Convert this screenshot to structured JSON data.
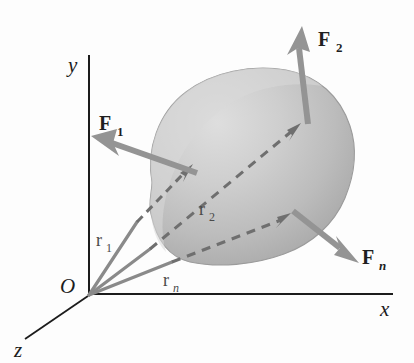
{
  "figure": {
    "background_color": "#fdfdfd"
  },
  "axes": {
    "origin_label": "O",
    "x_label": "x",
    "y_label": "y",
    "z_label": "z",
    "axis_color": "#1c1c1c",
    "origin_point": {
      "x": 89,
      "y": 295
    }
  },
  "body": {
    "name": "rigid-body-blob",
    "fill_light": "#d8d8d8",
    "fill_mid": "#b8b8b8",
    "fill_dark": "#9a9a9a",
    "outline_color": "#8f8f8f"
  },
  "forces": [
    {
      "id": "F1",
      "label": "F",
      "subscript": "1",
      "subscript_italic": false,
      "color": "#909090",
      "label_x": 103,
      "label_y": 128,
      "sub_x": 122,
      "sub_y": 134,
      "tail": {
        "x": 196,
        "y": 172
      },
      "tip": {
        "x": 93,
        "y": 141
      }
    },
    {
      "id": "F2",
      "label": "F",
      "subscript": "2",
      "subscript_italic": false,
      "color": "#909090",
      "label_x": 322,
      "label_y": 44,
      "sub_x": 341,
      "sub_y": 50,
      "tail": {
        "x": 306,
        "y": 122
      },
      "tip": {
        "x": 302,
        "y": 28
      }
    },
    {
      "id": "Fn",
      "label": "F",
      "subscript": "n",
      "subscript_italic": true,
      "color": "#909090",
      "label_x": 365,
      "label_y": 262,
      "sub_x": 383,
      "sub_y": 268,
      "tail": {
        "x": 294,
        "y": 212
      },
      "tip": {
        "x": 358,
        "y": 262
      }
    }
  ],
  "position_vectors": [
    {
      "id": "r1",
      "label": "r",
      "subscript": "1",
      "subscript_italic": false,
      "color": "#8a8a8a",
      "dash_color": "#6f6f6f",
      "label_x": 100,
      "label_y": 241,
      "sub_x": 111,
      "sub_y": 247,
      "solid_start": {
        "x": 89,
        "y": 295
      },
      "solid_end": {
        "x": 137,
        "y": 222
      },
      "dash_end": {
        "x": 190,
        "y": 168
      }
    },
    {
      "id": "r2",
      "label": "r",
      "subscript": "2",
      "subscript_italic": false,
      "color": "#8a8a8a",
      "dash_color": "#6f6f6f",
      "label_x": 203,
      "label_y": 210,
      "sub_x": 214,
      "sub_y": 216,
      "solid_start": {
        "x": 89,
        "y": 295
      },
      "solid_end": {
        "x": 148,
        "y": 250
      },
      "dash_end": {
        "x": 300,
        "y": 124
      }
    },
    {
      "id": "rn",
      "label": "r",
      "subscript": "n",
      "subscript_italic": true,
      "color": "#8a8a8a",
      "dash_color": "#6f6f6f",
      "label_x": 167,
      "label_y": 281,
      "sub_x": 178,
      "sub_y": 287,
      "solid_start": {
        "x": 89,
        "y": 295
      },
      "solid_end": {
        "x": 170,
        "y": 263
      },
      "dash_end": {
        "x": 289,
        "y": 214
      }
    }
  ]
}
